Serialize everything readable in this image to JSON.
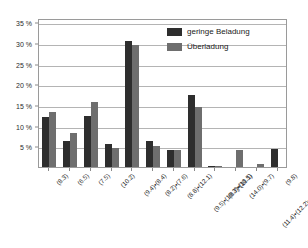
{
  "chart_data": {
    "type": "bar",
    "title": "",
    "subtitle": "",
    "xlabel": "",
    "ylabel": "",
    "ylim": [
      0,
      36
    ],
    "ytick_values": [
      5,
      10,
      15,
      20,
      25,
      30,
      35
    ],
    "ytick_labels": [
      "5 %",
      "10 %",
      "15 %",
      "20 %",
      "25 %",
      "30 %",
      "35 %"
    ],
    "grid": true,
    "legend_position": "top-right-inside",
    "categories": [
      "(8.3)",
      "(6.5)",
      "(7.5)",
      "(10.2)",
      "(9.4)•(8.4)",
      "(8.2)•(7.6)",
      "(8.8)•(12.1)",
      "(9.5)•(10.3)•(10.5)",
      "(8.7)•(11.1)",
      "(14.0)•(9.7)",
      "(11.4)•(12.2)•(13.0)•(10.6)",
      "(9.8)"
    ],
    "series": [
      {
        "name": "geringe Beladung",
        "color": "#2e2e2e",
        "values": [
          12.1,
          6.4,
          12.3,
          5.5,
          30.5,
          6.2,
          4.0,
          17.4,
          0.3,
          0.0,
          0.0,
          4.3
        ]
      },
      {
        "name": "Überladung",
        "color": "#6e6e6e",
        "values": [
          13.4,
          8.3,
          15.7,
          4.7,
          29.4,
          5.1,
          4.1,
          14.5,
          0.3,
          4.0,
          0.8,
          0.0
        ]
      }
    ]
  },
  "legend": {
    "items": [
      {
        "label": "geringe Beladung",
        "color": "#2e2e2e"
      },
      {
        "label": "Überladung",
        "color": "#6e6e6e"
      }
    ]
  },
  "colors": {
    "series_dark": "#2e2e2e",
    "series_gray": "#6e6e6e",
    "gridline": "#b4b4b4",
    "frame": "#9a9a9a",
    "background": "#ffffff",
    "text": "#2b2b2b"
  }
}
